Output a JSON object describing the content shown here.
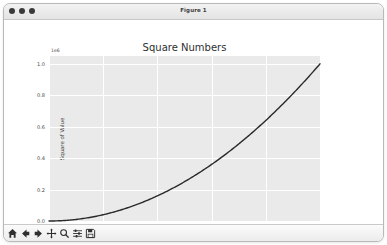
{
  "window": {
    "title": "Figure 1",
    "controls": [
      {
        "name": "close-button",
        "color": "#3a3a3a"
      },
      {
        "name": "minimize-button",
        "color": "#3a3a3a"
      },
      {
        "name": "maximize-button",
        "color": "#3a3a3a"
      }
    ]
  },
  "toolbar": {
    "buttons": [
      {
        "name": "home-button",
        "icon": "home-icon",
        "tooltip": "Reset original view"
      },
      {
        "name": "back-button",
        "icon": "arrow-left-icon",
        "tooltip": "Back to previous view"
      },
      {
        "name": "forward-button",
        "icon": "arrow-right-icon",
        "tooltip": "Forward to next view"
      },
      {
        "name": "pan-button",
        "icon": "move-cross-icon",
        "tooltip": "Pan axes with left mouse, zoom with right"
      },
      {
        "name": "zoom-button",
        "icon": "magnifier-icon",
        "tooltip": "Zoom to rectangle"
      },
      {
        "name": "configure-subplots-button",
        "icon": "sliders-icon",
        "tooltip": "Configure subplots"
      },
      {
        "name": "save-button",
        "icon": "floppy-disk-icon",
        "tooltip": "Save the figure"
      }
    ]
  },
  "chart_data": {
    "type": "line",
    "title": "Square Numbers",
    "xlabel": "Value",
    "ylabel": "Square of Value",
    "offset_text": "1e6",
    "xlim": [
      0,
      1000
    ],
    "ylim": [
      0,
      1050000
    ],
    "xticks": [
      0,
      200,
      400,
      600,
      800,
      1000
    ],
    "xticklabels": [
      "0",
      "200",
      "400",
      "600",
      "800",
      "1000"
    ],
    "yticks": [
      0,
      200000,
      400000,
      600000,
      800000,
      1000000
    ],
    "yticklabels": [
      "0.0",
      "0.2",
      "0.4",
      "0.6",
      "0.8",
      "1.0"
    ],
    "grid": true,
    "legend": "none",
    "axes_facecolor": "#eaeaea",
    "figure_facecolor": "#ffffff",
    "gridcolor": "#ffffff",
    "series": [
      {
        "name": "squares",
        "color": "#2a2a2a",
        "linewidth": 1.4,
        "x": [
          0,
          50,
          100,
          150,
          200,
          250,
          300,
          350,
          400,
          450,
          500,
          550,
          600,
          650,
          700,
          750,
          800,
          850,
          900,
          950,
          1000
        ],
        "y": [
          0,
          2500,
          10000,
          22500,
          40000,
          62500,
          90000,
          122500,
          160000,
          202500,
          250000,
          302500,
          360000,
          422500,
          490000,
          562500,
          640000,
          722500,
          810000,
          902500,
          1000000
        ]
      }
    ]
  }
}
